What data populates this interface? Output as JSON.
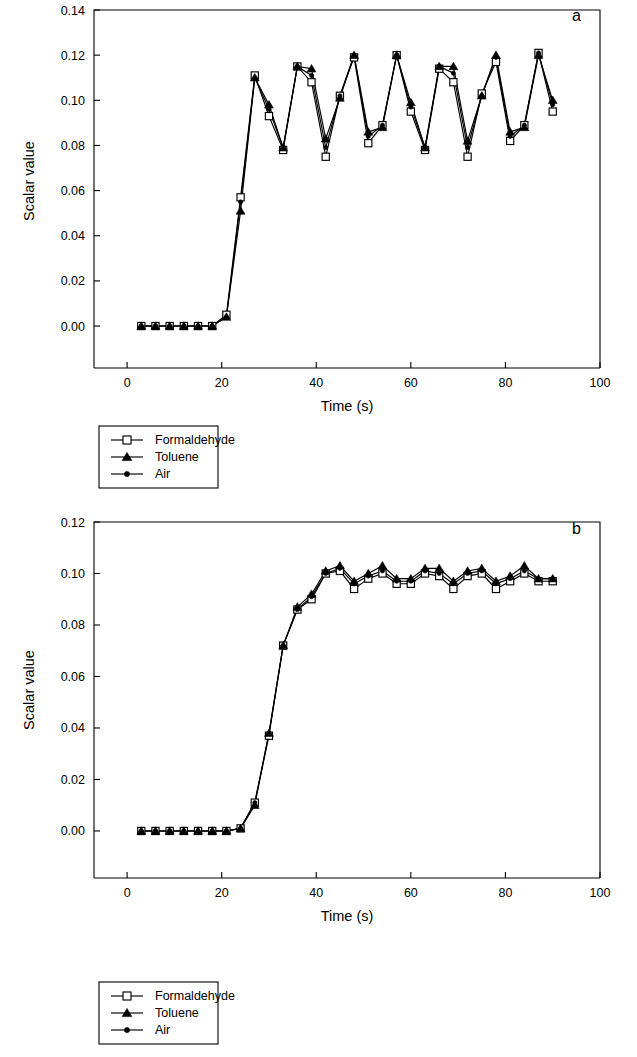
{
  "figure": {
    "background_color": "#ffffff",
    "ink_color": "#000000"
  },
  "panels": [
    {
      "id": "a",
      "label": "a",
      "xlabel": "Time (s)",
      "ylabel": "Scalar value",
      "xticks": [
        "0",
        "20",
        "40",
        "60",
        "80",
        "100"
      ],
      "yticks": [
        "0.00",
        "0.02",
        "0.04",
        "0.06",
        "0.08",
        "0.10",
        "0.12",
        "0.14"
      ]
    },
    {
      "id": "b",
      "label": "b",
      "xlabel": "Time (s)",
      "ylabel": "Scalar value",
      "xticks": [
        "0",
        "20",
        "40",
        "60",
        "80",
        "100"
      ],
      "yticks": [
        "0.00",
        "0.02",
        "0.04",
        "0.06",
        "0.08",
        "0.10",
        "0.12"
      ]
    }
  ],
  "legend": {
    "entries": [
      {
        "label": "Formaldehyde",
        "marker": "open-square"
      },
      {
        "label": "Toluene",
        "marker": "filled-triangle"
      },
      {
        "label": "Air",
        "marker": "filled-circle"
      }
    ]
  },
  "chart_data": [
    {
      "type": "line",
      "panel": "a",
      "title": "",
      "xlabel": "Time (s)",
      "ylabel": "Scalar value",
      "xlim": [
        -7,
        100
      ],
      "ylim": [
        -0.0115,
        0.14
      ],
      "xticks": [
        0,
        20,
        40,
        60,
        80,
        100
      ],
      "yticks": [
        0.0,
        0.02,
        0.04,
        0.06,
        0.08,
        0.1,
        0.12,
        0.14
      ],
      "grid": false,
      "legend_position": "below-plot-left",
      "annotations": [
        {
          "text": "a",
          "x": 95,
          "y": 0.135
        }
      ],
      "x": [
        3,
        6,
        9,
        12,
        15,
        18,
        21,
        24,
        27,
        30,
        33,
        36,
        39,
        42,
        45,
        48,
        51,
        54,
        57,
        60,
        63,
        66,
        69,
        72,
        75,
        78,
        81,
        84,
        87,
        90
      ],
      "series": [
        {
          "name": "Formaldehyde",
          "marker": "open-square",
          "values": [
            0.0,
            0.0,
            0.0,
            0.0,
            0.0,
            0.0,
            0.005,
            0.057,
            0.111,
            0.093,
            0.078,
            0.115,
            0.108,
            0.075,
            0.102,
            0.119,
            0.081,
            0.089,
            0.12,
            0.095,
            0.078,
            0.114,
            0.108,
            0.075,
            0.103,
            0.117,
            0.082,
            0.089,
            0.121,
            0.095
          ]
        },
        {
          "name": "Toluene",
          "marker": "filled-triangle",
          "values": [
            0.0,
            0.0,
            0.0,
            0.0,
            0.0,
            0.0,
            0.004,
            0.051,
            0.11,
            0.098,
            0.079,
            0.115,
            0.114,
            0.083,
            0.101,
            0.12,
            0.086,
            0.088,
            0.12,
            0.099,
            0.079,
            0.115,
            0.115,
            0.082,
            0.102,
            0.12,
            0.086,
            0.088,
            0.12,
            0.1
          ]
        },
        {
          "name": "Air",
          "marker": "filled-circle",
          "values": [
            0.0,
            0.0,
            0.0,
            0.0,
            0.0,
            0.0,
            0.004,
            0.055,
            0.11,
            0.096,
            0.079,
            0.115,
            0.111,
            0.079,
            0.102,
            0.12,
            0.084,
            0.089,
            0.12,
            0.097,
            0.079,
            0.115,
            0.112,
            0.079,
            0.102,
            0.119,
            0.084,
            0.089,
            0.121,
            0.098
          ]
        }
      ]
    },
    {
      "type": "line",
      "panel": "b",
      "title": "",
      "xlabel": "Time (s)",
      "ylabel": "Scalar value",
      "xlim": [
        -7,
        100
      ],
      "ylim": [
        -0.0105,
        0.12
      ],
      "xticks": [
        0,
        20,
        40,
        60,
        80,
        100
      ],
      "yticks": [
        0.0,
        0.02,
        0.04,
        0.06,
        0.08,
        0.1,
        0.12
      ],
      "grid": false,
      "legend_position": "below-plot-left",
      "annotations": [
        {
          "text": "b",
          "x": 95,
          "y": 0.1155
        }
      ],
      "x": [
        3,
        6,
        9,
        12,
        15,
        18,
        21,
        24,
        27,
        30,
        33,
        36,
        39,
        42,
        45,
        48,
        51,
        54,
        57,
        60,
        63,
        66,
        69,
        72,
        75,
        78,
        81,
        84,
        87,
        90
      ],
      "series": [
        {
          "name": "Formaldehyde",
          "marker": "open-square",
          "values": [
            0.0,
            0.0,
            0.0,
            0.0,
            0.0,
            0.0,
            0.0,
            0.001,
            0.011,
            0.037,
            0.072,
            0.086,
            0.09,
            0.1,
            0.101,
            0.094,
            0.098,
            0.1,
            0.096,
            0.096,
            0.1,
            0.099,
            0.094,
            0.099,
            0.1,
            0.094,
            0.097,
            0.1,
            0.097,
            0.097
          ]
        },
        {
          "name": "Toluene",
          "marker": "filled-triangle",
          "values": [
            0.0,
            0.0,
            0.0,
            0.0,
            0.0,
            0.0,
            0.0,
            0.001,
            0.01,
            0.038,
            0.072,
            0.087,
            0.092,
            0.101,
            0.103,
            0.097,
            0.1,
            0.103,
            0.098,
            0.098,
            0.102,
            0.102,
            0.097,
            0.101,
            0.102,
            0.097,
            0.099,
            0.103,
            0.098,
            0.098
          ]
        },
        {
          "name": "Air",
          "marker": "filled-circle",
          "values": [
            0.0,
            0.0,
            0.0,
            0.0,
            0.0,
            0.0,
            0.0,
            0.001,
            0.011,
            0.038,
            0.072,
            0.086,
            0.091,
            0.1,
            0.102,
            0.096,
            0.099,
            0.101,
            0.097,
            0.097,
            0.101,
            0.1,
            0.096,
            0.1,
            0.101,
            0.096,
            0.098,
            0.101,
            0.098,
            0.098
          ]
        }
      ]
    }
  ]
}
